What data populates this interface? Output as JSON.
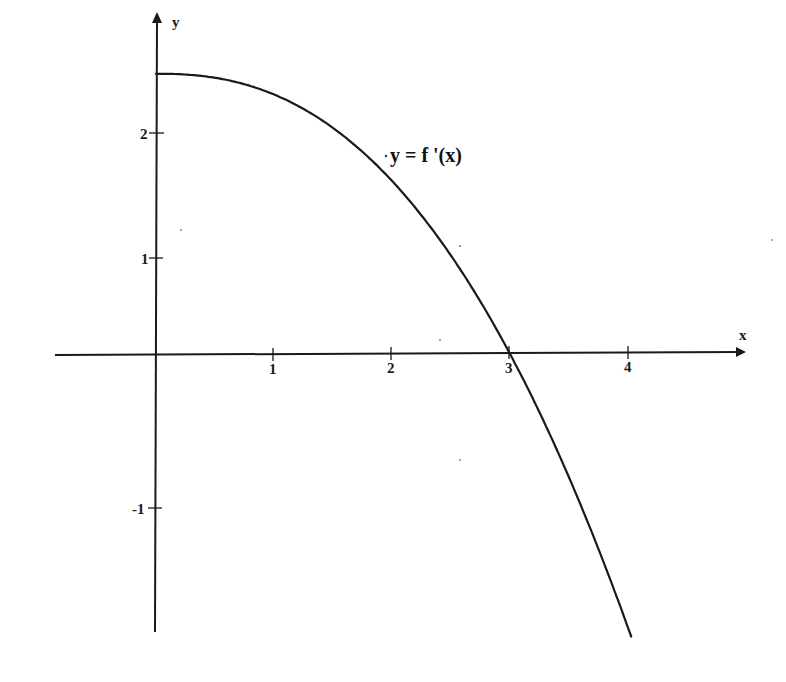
{
  "chart_data": {
    "type": "line",
    "title": "",
    "xlabel": "x",
    "ylabel": "y",
    "annotation": "y = f '(x)",
    "x_ticks": [
      1,
      2,
      3,
      4
    ],
    "y_ticks": [
      2,
      1,
      -1
    ],
    "xlim": [
      -0.85,
      4.95
    ],
    "ylim": [
      -2.2,
      2.7
    ],
    "grid": false,
    "legend": "none",
    "series": [
      {
        "name": "y = f '(x)",
        "x": [
          0,
          0.5,
          1.0,
          1.5,
          2.0,
          2.5,
          3.0,
          3.5,
          4.0
        ],
        "values": [
          2.25,
          2.19,
          2.0,
          1.69,
          1.46,
          0.84,
          0.0,
          -1.0,
          -2.2
        ]
      }
    ]
  },
  "axes": {
    "x_name": "x",
    "y_name": "y",
    "x_tick_labels": [
      "1",
      "2",
      "3",
      "4"
    ],
    "y_tick_labels": [
      "2",
      "1",
      "-1"
    ]
  },
  "labels": {
    "curve": "y = f '(x)"
  },
  "colors": {
    "ink": "#1a1a1a",
    "background": "#ffffff"
  }
}
